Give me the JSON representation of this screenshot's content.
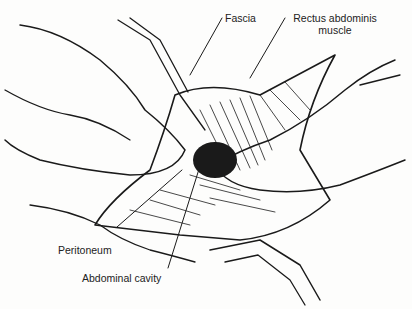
{
  "figure": {
    "labels": {
      "fascia": "Fascia",
      "rectus_line1": "Rectus abdominis",
      "rectus_line2": "muscle",
      "peritoneum": "Peritoneum",
      "abdominal_cavity": "Abdominal cavity"
    },
    "colors": {
      "ink": "#1a1a1a",
      "paper": "#fdfdfc"
    }
  }
}
